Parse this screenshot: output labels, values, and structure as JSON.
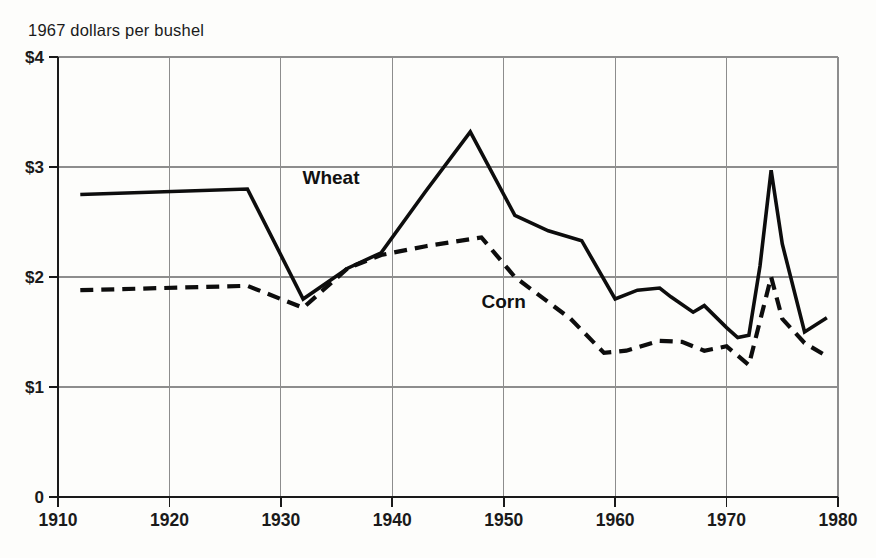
{
  "chart_data": {
    "type": "line",
    "title": "1967 dollars per bushel",
    "xlabel": "",
    "ylabel": "1967 dollars per bushel",
    "xlim": [
      1910,
      1980
    ],
    "ylim": [
      0,
      4
    ],
    "grid": true,
    "legend": "inline-labels",
    "x_ticks": [
      "1910",
      "1920",
      "1930",
      "1940",
      "1950",
      "1960",
      "1970",
      "1980"
    ],
    "x_tick_values": [
      1910,
      1920,
      1930,
      1940,
      1950,
      1960,
      1970,
      1980
    ],
    "y_ticks": [
      "0",
      "$1",
      "$2",
      "$3",
      "$4"
    ],
    "y_tick_values": [
      0,
      1,
      2,
      3,
      4
    ],
    "series": [
      {
        "name": "Wheat",
        "style": "solid",
        "color": "#0d0d0d",
        "label_text": "Wheat",
        "x": [
          1912,
          1927,
          1932,
          1936,
          1939,
          1943,
          1947,
          1951,
          1954,
          1957,
          1960,
          1962,
          1964,
          1965,
          1967,
          1968,
          1970,
          1971,
          1972,
          1973,
          1974,
          1975,
          1977,
          1979
        ],
        "values": [
          2.75,
          2.8,
          1.8,
          2.08,
          2.22,
          2.78,
          3.32,
          2.56,
          2.42,
          2.33,
          1.8,
          1.88,
          1.9,
          1.82,
          1.68,
          1.74,
          1.54,
          1.45,
          1.47,
          2.1,
          2.97,
          2.3,
          1.5,
          1.63
        ]
      },
      {
        "name": "Corn",
        "style": "dashed",
        "color": "#0d0d0d",
        "label_text": "Corn",
        "x": [
          1912,
          1927,
          1932,
          1936,
          1939,
          1943,
          1948,
          1951,
          1956,
          1959,
          1961,
          1964,
          1966,
          1968,
          1970,
          1972,
          1973,
          1974,
          1975,
          1977,
          1979
        ],
        "values": [
          1.88,
          1.92,
          1.72,
          2.08,
          2.2,
          2.28,
          2.36,
          2.0,
          1.62,
          1.31,
          1.33,
          1.42,
          1.41,
          1.33,
          1.37,
          1.2,
          1.6,
          2.0,
          1.62,
          1.4,
          1.28
        ]
      }
    ],
    "annotations": [
      {
        "text": "Wheat",
        "x": 1934.5,
        "y": 2.85
      },
      {
        "text": "Corn",
        "x": 1950.0,
        "y": 1.72
      }
    ]
  }
}
